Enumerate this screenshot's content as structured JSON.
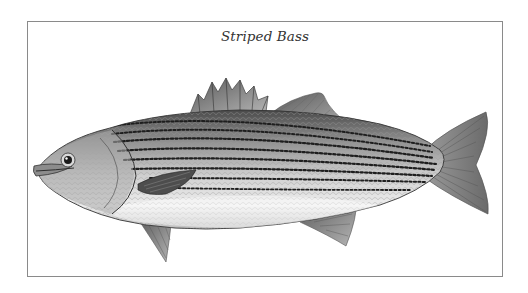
{
  "figure": {
    "caption": "Striped Bass",
    "style": "grayscale pen-and-ink scientific illustration",
    "frame_color": "#8a8a8a",
    "background": "#ffffff"
  }
}
